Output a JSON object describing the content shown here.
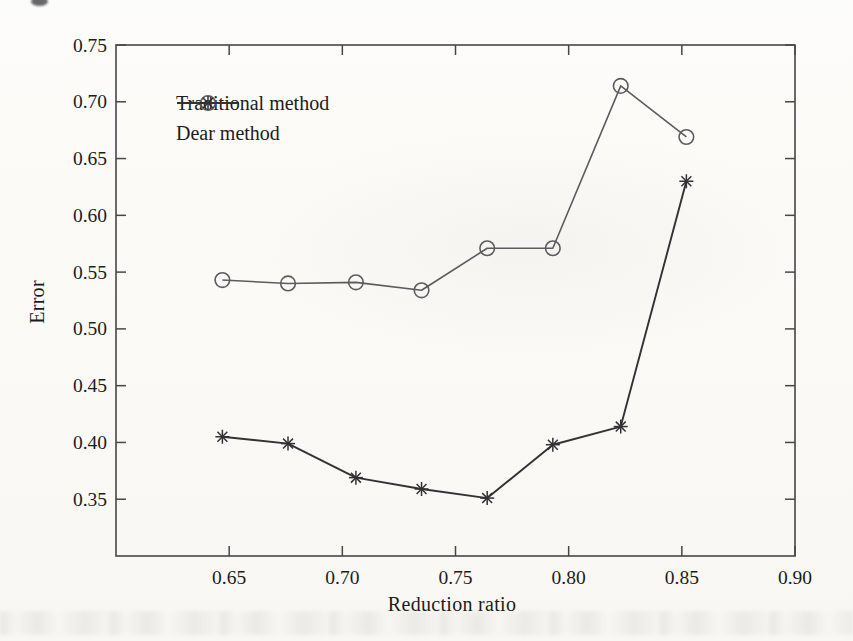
{
  "figure": {
    "background": "#fbfaf6",
    "axis_color": "#47474b",
    "text_color": "#1c1c20"
  },
  "chart_data": {
    "type": "line",
    "title": "",
    "xlabel": "Reduction ratio",
    "ylabel": "Error",
    "xlim": [
      0.6,
      0.9
    ],
    "ylim": [
      0.3,
      0.75
    ],
    "x_ticks": [
      0.65,
      0.7,
      0.75,
      0.8,
      0.85,
      0.9
    ],
    "y_ticks": [
      0.35,
      0.4,
      0.45,
      0.5,
      0.55,
      0.6,
      0.65,
      0.7,
      0.75
    ],
    "grid": false,
    "legend_position": "upper-left-inside",
    "x": [
      0.647,
      0.676,
      0.706,
      0.735,
      0.764,
      0.793,
      0.823,
      0.852
    ],
    "series": [
      {
        "name": "Traditional method",
        "marker": "circle",
        "color": "#5c5c60",
        "line_width": 1.6,
        "values": [
          0.543,
          0.54,
          0.541,
          0.534,
          0.571,
          0.571,
          0.714,
          0.669
        ]
      },
      {
        "name": "Dear method",
        "marker": "asterisk",
        "color": "#323236",
        "line_width": 1.9,
        "values": [
          0.405,
          0.399,
          0.369,
          0.359,
          0.351,
          0.398,
          0.414,
          0.63
        ]
      }
    ]
  }
}
